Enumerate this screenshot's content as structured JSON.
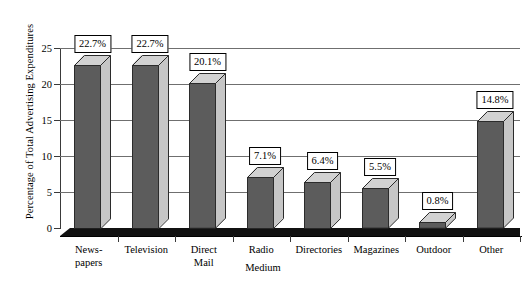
{
  "chart_data": {
    "type": "bar",
    "title": "",
    "subtitle": "",
    "xlabel": "Medium",
    "ylabel": "Percentage of Total Advertising Expenditures",
    "categories": [
      "News-\npapers",
      "Television",
      "Direct\nMail",
      "Radio",
      "Directories",
      "Magazines",
      "Outdoor",
      "Other"
    ],
    "values": [
      22.7,
      22.7,
      20.1,
      7.1,
      6.4,
      5.5,
      0.8,
      14.8
    ],
    "data_labels": [
      "22.7%",
      "22.7%",
      "20.1%",
      "7.1%",
      "6.4%",
      "5.5%",
      "0.8%",
      "14.8%"
    ],
    "ylim": [
      0,
      25
    ],
    "yticks": [
      0,
      5,
      10,
      15,
      20,
      25
    ],
    "ytick_labels": [
      "0",
      "5",
      "10",
      "15",
      "20",
      "25"
    ],
    "grid": true,
    "legend": "none",
    "style": "3d-column",
    "colors": {
      "bar_front": "#5c5c5c",
      "bar_side": "#c6c6c6",
      "bar_top": "#d2d2d2",
      "bar_outline": "#2b2b2b",
      "gridline": "#6f6f6f",
      "axis": "#3a3a3a",
      "background": "#ffffff",
      "label_box_fill": "#ffffff",
      "label_box_border": "#000000",
      "floor": "#111111"
    }
  }
}
